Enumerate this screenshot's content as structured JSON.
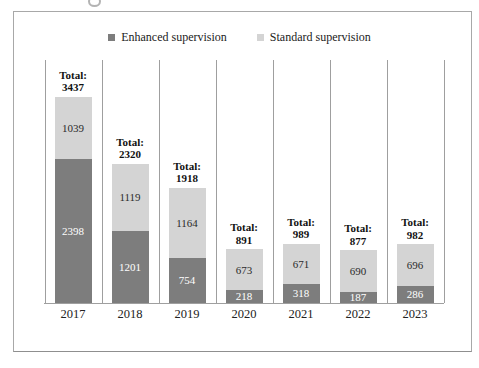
{
  "page": {
    "background": "#ffffff",
    "frame_border_color": "#a8a8a8"
  },
  "legend": {
    "position": "top-center",
    "items": [
      {
        "label": "Enhanced supervision",
        "color": "#7d7d7d"
      },
      {
        "label": "Standard supervision",
        "color": "#d4d4d4"
      }
    ]
  },
  "chart_data": {
    "type": "bar",
    "stacked": true,
    "title": "",
    "xlabel": "",
    "ylabel": "",
    "grid": "vertical-category-separators",
    "legend_position": "top-center",
    "ylim": [
      0,
      3437
    ],
    "categories": [
      "2017",
      "2018",
      "2019",
      "2020",
      "2021",
      "2022",
      "2023"
    ],
    "series": [
      {
        "name": "Enhanced supervision",
        "color": "#7d7d7d",
        "label_color": "#ffffff",
        "values": [
          2398,
          1201,
          754,
          218,
          318,
          187,
          286
        ]
      },
      {
        "name": "Standard supervision",
        "color": "#d4d4d4",
        "label_color": "#2b2b2b",
        "values": [
          1039,
          1119,
          1164,
          673,
          671,
          690,
          696
        ]
      }
    ],
    "totals": [
      3437,
      2320,
      1918,
      891,
      989,
      877,
      982
    ],
    "total_label_prefix": "Total:",
    "axis_color": "#9f9f9f"
  }
}
